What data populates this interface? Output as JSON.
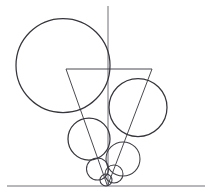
{
  "figure": {
    "title": "geometric-line-drawing",
    "canvas": {
      "width": 211,
      "height": 196,
      "background": "#ffffff"
    },
    "colors": {
      "ink": "#35353c",
      "ink_light": "#4a4a52",
      "axis": "#6e6e78",
      "background": "#ffffff"
    },
    "shapes": {
      "circles": [
        {
          "name": "large-circle",
          "cx": 63,
          "cy": 65.5,
          "r": 47,
          "stroke": "#35353c",
          "stroke_width": 1.25
        },
        {
          "name": "right-circle",
          "cx": 138,
          "cy": 107.5,
          "r": 29,
          "stroke": "#35353c",
          "stroke_width": 1.25
        },
        {
          "name": "mid-left-circle",
          "cx": 89,
          "cy": 139,
          "r": 21,
          "stroke": "#35353c",
          "stroke_width": 1.25
        },
        {
          "name": "lower-right-circle",
          "cx": 123,
          "cy": 159,
          "r": 17,
          "stroke": "#3d3d44",
          "stroke_width": 1.05
        },
        {
          "name": "small-left-circle",
          "cx": 97.5,
          "cy": 169,
          "r": 11,
          "stroke": "#3d3d44",
          "stroke_width": 1.05
        },
        {
          "name": "small-right-circle",
          "cx": 114,
          "cy": 174,
          "r": 9,
          "stroke": "#3d3d44",
          "stroke_width": 1.05
        },
        {
          "name": "tiny-circle",
          "cx": 106,
          "cy": 180,
          "r": 6,
          "stroke": "#3d3d44",
          "stroke_width": 1.05
        }
      ],
      "triangle": {
        "name": "inverted-triangle",
        "points": "66,69 152,69 107.5,186",
        "stroke": "#4a4a52",
        "stroke_width": 1
      },
      "vertical_axis": {
        "name": "vertical-axis",
        "x": 108,
        "y1": 6,
        "y2": 186,
        "stroke": "#6e6e78"
      },
      "baseline": {
        "name": "horizontal-baseline",
        "y": 186,
        "x1": 7,
        "x2": 205,
        "stroke": "#6e6e78"
      }
    }
  }
}
